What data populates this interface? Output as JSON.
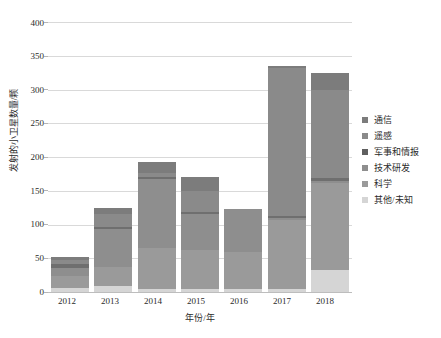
{
  "chart_data": {
    "type": "bar",
    "subtype": "stacked-vertical",
    "title": "",
    "xlabel": "年份/年",
    "ylabel": "发射的小卫星数量/颗",
    "categories": [
      "2012",
      "2013",
      "2014",
      "2015",
      "2016",
      "2017",
      "2018"
    ],
    "ylim": [
      0,
      400
    ],
    "yticks": [
      0,
      50,
      100,
      150,
      200,
      250,
      300,
      350,
      400
    ],
    "grid": true,
    "legend_position": "right",
    "series": [
      {
        "name": "其他/未知",
        "color": "#d5d5d5",
        "values": [
          6,
          9,
          5,
          5,
          4,
          4,
          33
        ]
      },
      {
        "name": "科学",
        "color": "#9a9a9a",
        "values": [
          18,
          28,
          60,
          57,
          56,
          103,
          128
        ]
      },
      {
        "name": "技术研发",
        "color": "#8e8e8e",
        "values": [
          12,
          56,
          103,
          54,
          63,
          3,
          3
        ]
      },
      {
        "name": "军事和情报",
        "color": "#6f6f6f",
        "values": [
          6,
          4,
          3,
          3,
          0,
          3,
          5
        ]
      },
      {
        "name": "遥感",
        "color": "#8a8a8a",
        "values": [
          5,
          18,
          6,
          30,
          0,
          219,
          130
        ]
      },
      {
        "name": "通信",
        "color": "#7c7c7c",
        "values": [
          5,
          10,
          15,
          21,
          0,
          3,
          26
        ]
      }
    ],
    "totals": [
      52,
      125,
      192,
      170,
      123,
      335,
      325
    ],
    "axis_color": "#bdbdbd",
    "grid_color": "#d9d9d9"
  },
  "legend": {
    "items": [
      {
        "label": "通信",
        "color": "#7c7c7c"
      },
      {
        "label": "遥感",
        "color": "#8a8a8a"
      },
      {
        "label": "军事和情报",
        "color": "#5f5f5f"
      },
      {
        "label": "技术研发",
        "color": "#8e8e8e"
      },
      {
        "label": "科学",
        "color": "#9a9a9a"
      },
      {
        "label": "其他/未知",
        "color": "#d5d5d5"
      }
    ]
  }
}
